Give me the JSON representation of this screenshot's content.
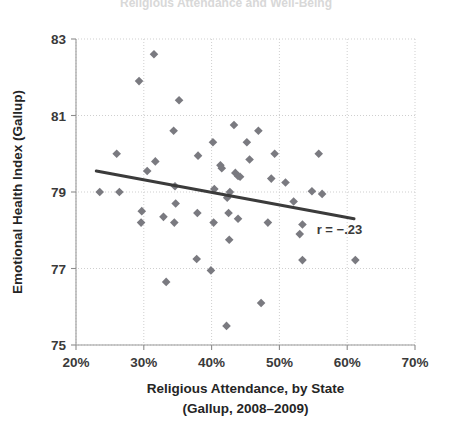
{
  "figure": {
    "cut_off_title": "Religious Attendance and Well-Being",
    "annotation": "r = −.23",
    "marker_color": "#7a7a80",
    "trend_color": "#3b3b3b",
    "axis_color": "#9a9a9a"
  },
  "chart_data": {
    "type": "scatter",
    "title": "",
    "xlabel": "Religious Attendance, by State",
    "xlabel_line2": "(Gallup, 2008–2009)",
    "ylabel": "Emotional Health Index (Gallup)",
    "xlim": [
      20,
      70
    ],
    "ylim": [
      75,
      83
    ],
    "xticks": [
      20,
      30,
      40,
      50,
      60,
      70
    ],
    "xticklabels": [
      "20%",
      "30%",
      "40%",
      "50%",
      "60%",
      "70%"
    ],
    "yticks": [
      75,
      77,
      79,
      81,
      83
    ],
    "yticklabels": [
      "75",
      "77",
      "79",
      "81",
      "83"
    ],
    "grid": false,
    "legend": null,
    "annotations": [
      {
        "text": "r = −.23",
        "x": 55.5,
        "y": 77.9
      }
    ],
    "correlation": -0.23,
    "trendline": {
      "type": "linear",
      "x_start": 23.0,
      "y_start": 79.55,
      "x_end": 61.0,
      "y_end": 78.3,
      "slope": -0.0329,
      "intercept": 80.31
    },
    "n_points": 51,
    "points": [
      {
        "x": 31.5,
        "y": 82.6
      },
      {
        "x": 29.3,
        "y": 81.9
      },
      {
        "x": 35.2,
        "y": 81.4
      },
      {
        "x": 43.3,
        "y": 80.75
      },
      {
        "x": 34.4,
        "y": 80.6
      },
      {
        "x": 46.9,
        "y": 80.6
      },
      {
        "x": 40.2,
        "y": 80.3
      },
      {
        "x": 45.2,
        "y": 80.3
      },
      {
        "x": 26.0,
        "y": 80.0
      },
      {
        "x": 49.3,
        "y": 80.0
      },
      {
        "x": 55.8,
        "y": 80.0
      },
      {
        "x": 38.0,
        "y": 79.95
      },
      {
        "x": 45.6,
        "y": 79.85
      },
      {
        "x": 31.7,
        "y": 79.8
      },
      {
        "x": 41.3,
        "y": 79.7
      },
      {
        "x": 41.5,
        "y": 79.62
      },
      {
        "x": 30.5,
        "y": 79.55
      },
      {
        "x": 43.5,
        "y": 79.5
      },
      {
        "x": 43.9,
        "y": 79.42
      },
      {
        "x": 44.2,
        "y": 79.4
      },
      {
        "x": 48.8,
        "y": 79.35
      },
      {
        "x": 50.9,
        "y": 79.25
      },
      {
        "x": 34.6,
        "y": 79.15
      },
      {
        "x": 40.4,
        "y": 79.08
      },
      {
        "x": 42.7,
        "y": 79.0
      },
      {
        "x": 23.5,
        "y": 79.0
      },
      {
        "x": 26.4,
        "y": 79.0
      },
      {
        "x": 54.8,
        "y": 79.02
      },
      {
        "x": 56.3,
        "y": 78.95
      },
      {
        "x": 42.3,
        "y": 78.85
      },
      {
        "x": 52.1,
        "y": 78.75
      },
      {
        "x": 34.7,
        "y": 78.7
      },
      {
        "x": 29.7,
        "y": 78.5
      },
      {
        "x": 37.9,
        "y": 78.45
      },
      {
        "x": 42.5,
        "y": 78.45
      },
      {
        "x": 32.9,
        "y": 78.35
      },
      {
        "x": 43.9,
        "y": 78.3
      },
      {
        "x": 29.6,
        "y": 78.2
      },
      {
        "x": 34.5,
        "y": 78.2
      },
      {
        "x": 40.3,
        "y": 78.2
      },
      {
        "x": 48.3,
        "y": 78.2
      },
      {
        "x": 53.4,
        "y": 78.15
      },
      {
        "x": 53.0,
        "y": 77.9
      },
      {
        "x": 42.6,
        "y": 77.75
      },
      {
        "x": 37.8,
        "y": 77.25
      },
      {
        "x": 53.4,
        "y": 77.22
      },
      {
        "x": 61.2,
        "y": 77.22
      },
      {
        "x": 39.9,
        "y": 76.95
      },
      {
        "x": 33.3,
        "y": 76.65
      },
      {
        "x": 47.3,
        "y": 76.1
      },
      {
        "x": 42.2,
        "y": 75.5
      }
    ]
  }
}
